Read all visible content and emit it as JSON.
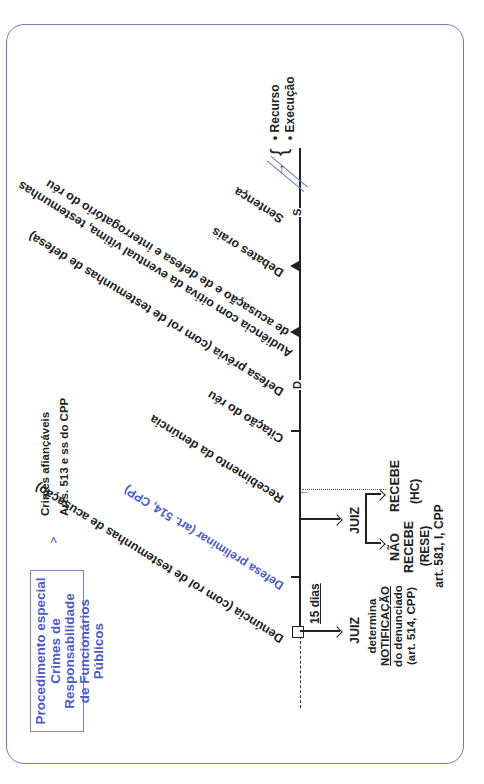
{
  "header": {
    "title_lines": [
      "Procedimento especial",
      "Crimes de Responsabilidade",
      "de Funcionários Públicos"
    ],
    "scope_lines": [
      "Crimes afiançáveis",
      "Arts. 513 e ss do CPP"
    ]
  },
  "timeline": {
    "events": [
      {
        "id": "denuncia",
        "marker": "square",
        "label": "Denúncia (com rol de testemunhas de acusação)"
      },
      {
        "id": "defesa_preliminar",
        "marker": "tick",
        "label": "Defesa preliminar (art. 514, CPP)"
      },
      {
        "id": "recebimento",
        "marker": "none",
        "label": "Recebimento da denúncia"
      },
      {
        "id": "citacao",
        "marker": "tick",
        "label": "Citação do réu"
      },
      {
        "id": "defesa_previa",
        "marker": "D",
        "label": "Defesa prévia (com rol de testemunhas de defesa)"
      },
      {
        "id": "audiencia",
        "marker": "triangle",
        "label_lines": [
          "Audiência com oitiva da eventual vítima, testemunhas",
          "de acusação e de defesa e interrogatório do réu"
        ]
      },
      {
        "id": "debates",
        "marker": "triangle",
        "label": "Debates orais"
      },
      {
        "id": "sentenca",
        "marker": "S",
        "label": "Sentença"
      }
    ],
    "deadline": "15 dias",
    "after_sentence": [
      "Recurso",
      "Execução"
    ]
  },
  "judge_notification": {
    "actor": "JUIZ",
    "lines": [
      "determina",
      "NOTIFICAÇÃO",
      "do denunciado",
      "(art. 514, CPP)"
    ]
  },
  "judge_decision": {
    "actor": "JUIZ",
    "receives": {
      "label": "RECEBE",
      "remedy": "(HC)"
    },
    "rejects": {
      "label_lines": [
        "NÃO",
        "RECEBE"
      ],
      "remedy": "(RESE)",
      "legal_basis": "art. 581, I, CPP"
    }
  },
  "colors": {
    "accent": "#4b5cc4",
    "frame": "#6a78c8",
    "text": "#222222"
  }
}
